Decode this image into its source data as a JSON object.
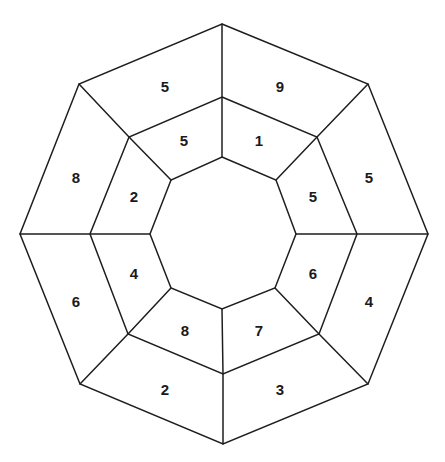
{
  "diagram": {
    "stroke_color": "#1e1e1e",
    "text_color": "#1a1a1a",
    "octagons": {
      "outer": [
        [
          222,
          24
        ],
        [
          368,
          84
        ],
        [
          428,
          234
        ],
        [
          368,
          384
        ],
        [
          223,
          444
        ],
        [
          80,
          384
        ],
        [
          20,
          234
        ],
        [
          79,
          84
        ]
      ],
      "middle": [
        [
          222,
          97
        ],
        [
          317,
          137
        ],
        [
          357,
          234
        ],
        [
          319,
          334
        ],
        [
          223,
          374
        ],
        [
          128,
          334
        ],
        [
          90,
          234
        ],
        [
          129,
          137
        ]
      ],
      "inner": [
        [
          222,
          157
        ],
        [
          276,
          180
        ],
        [
          296,
          234
        ],
        [
          275,
          288
        ],
        [
          222,
          309
        ],
        [
          171,
          288
        ],
        [
          150,
          234
        ],
        [
          171,
          180
        ]
      ]
    },
    "outer_ring": {
      "cells": [
        {
          "position": "top-left",
          "value": "5",
          "x": 165,
          "y": 86
        },
        {
          "position": "top-right",
          "value": "9",
          "x": 280,
          "y": 86
        },
        {
          "position": "right-upper",
          "value": "5",
          "x": 369,
          "y": 177
        },
        {
          "position": "right-lower",
          "value": "4",
          "x": 369,
          "y": 301
        },
        {
          "position": "bottom-right",
          "value": "3",
          "x": 280,
          "y": 389
        },
        {
          "position": "bottom-left",
          "value": "2",
          "x": 165,
          "y": 389
        },
        {
          "position": "left-lower",
          "value": "6",
          "x": 76,
          "y": 301
        },
        {
          "position": "left-upper",
          "value": "8",
          "x": 76,
          "y": 177
        }
      ]
    },
    "middle_ring": {
      "cells": [
        {
          "position": "top-left",
          "value": "5",
          "x": 184,
          "y": 140
        },
        {
          "position": "top-right",
          "value": "1",
          "x": 259,
          "y": 140
        },
        {
          "position": "right-upper",
          "value": "5",
          "x": 313,
          "y": 196
        },
        {
          "position": "right-lower",
          "value": "6",
          "x": 313,
          "y": 273
        },
        {
          "position": "bottom-right",
          "value": "7",
          "x": 259,
          "y": 330
        },
        {
          "position": "bottom-left",
          "value": "8",
          "x": 185,
          "y": 330
        },
        {
          "position": "left-lower",
          "value": "4",
          "x": 134,
          "y": 273
        },
        {
          "position": "left-upper",
          "value": "2",
          "x": 134,
          "y": 196
        }
      ]
    },
    "center": {
      "value": ""
    }
  }
}
